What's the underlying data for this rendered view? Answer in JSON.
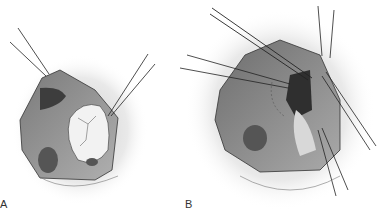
{
  "figure": {
    "panels": [
      {
        "id": "A",
        "label": "A"
      },
      {
        "id": "B",
        "label": "B"
      }
    ]
  },
  "colors": {
    "background": "#ffffff",
    "cavity_dark": "#5a5a5a",
    "cavity_mid": "#9a9a9a",
    "tissue_light": "#e6e6e6",
    "line": "#222222"
  }
}
